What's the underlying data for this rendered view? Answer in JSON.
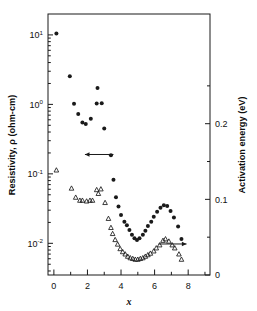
{
  "figure": {
    "background": "#ffffff",
    "foreground": "#1a1a1a"
  },
  "axes": {
    "left": {
      "title": "Resistivity, ρ (ohm-cm)",
      "scale": "log",
      "ticks": [
        {
          "mantissa": "10",
          "exponent": "1",
          "value": 10
        },
        {
          "mantissa": "10",
          "exponent": "0",
          "value": 1
        },
        {
          "mantissa": "10",
          "exponent": "-1",
          "value": 0.1
        },
        {
          "mantissa": "10",
          "exponent": "-2",
          "value": 0.01
        }
      ],
      "range": [
        0.0035,
        20
      ]
    },
    "right": {
      "title": "Activation energy (eV)",
      "scale": "linear",
      "ticks": [
        "0",
        "0.1",
        "0.2"
      ],
      "tick_values": [
        0,
        0.1,
        0.2
      ],
      "minor_tick_values": [
        0.05,
        0.15,
        0.25
      ],
      "range": [
        0,
        0.345
      ]
    },
    "bottom": {
      "title": "x",
      "scale": "linear",
      "ticks": [
        "0",
        "2",
        "4",
        "6",
        "8"
      ],
      "tick_values": [
        0,
        2,
        4,
        6,
        8
      ],
      "minor_tick_values": [
        1,
        3,
        5,
        7,
        9
      ],
      "range": [
        -0.35,
        9.3
      ]
    }
  },
  "annotations": [
    {
      "name": "left-pointing-arrow",
      "direction": "left",
      "x_start": 3.55,
      "x_end": 1.85,
      "y_value": 0.19,
      "axis": "left"
    },
    {
      "name": "right-pointing-arrow",
      "direction": "right",
      "x_start": 6.25,
      "x_end": 7.9,
      "y_value": 0.041,
      "axis": "right"
    }
  ],
  "chart_data": {
    "type": "scatter",
    "title": "",
    "xlabel": "x",
    "ylabel": "Resistivity, ρ (ohm-cm)",
    "y2label": "Activation energy (eV)",
    "xlim": [
      -0.35,
      9.3
    ],
    "ylim": [
      0.0035,
      20
    ],
    "y2lim": [
      0,
      0.345
    ],
    "yscale": "log",
    "grid": false,
    "legend": "none",
    "series": [
      {
        "name": "Resistivity",
        "marker": "filled-circle",
        "axis": "left",
        "points": [
          [
            0.15,
            10.5
          ],
          [
            0.95,
            2.55
          ],
          [
            1.2,
            1.02
          ],
          [
            1.45,
            0.73
          ],
          [
            1.7,
            0.55
          ],
          [
            1.9,
            0.52
          ],
          [
            2.2,
            0.62
          ],
          [
            2.55,
            1.03
          ],
          [
            2.6,
            1.72
          ],
          [
            2.85,
            1.04
          ],
          [
            3.0,
            0.45
          ],
          [
            3.4,
            0.185
          ],
          [
            3.55,
            0.082
          ],
          [
            3.7,
            0.046
          ],
          [
            3.85,
            0.034
          ],
          [
            4.0,
            0.0255
          ],
          [
            4.2,
            0.0205
          ],
          [
            4.35,
            0.0182
          ],
          [
            4.5,
            0.0155
          ],
          [
            4.65,
            0.0133
          ],
          [
            4.8,
            0.0118
          ],
          [
            4.95,
            0.0112
          ],
          [
            5.1,
            0.0118
          ],
          [
            5.3,
            0.0133
          ],
          [
            5.45,
            0.0152
          ],
          [
            5.6,
            0.0178
          ],
          [
            5.8,
            0.0205
          ],
          [
            5.95,
            0.0242
          ],
          [
            6.15,
            0.0285
          ],
          [
            6.35,
            0.0325
          ],
          [
            6.55,
            0.0352
          ],
          [
            6.75,
            0.0345
          ],
          [
            6.95,
            0.0292
          ],
          [
            7.15,
            0.0235
          ],
          [
            7.4,
            0.0175
          ],
          [
            7.6,
            0.0115
          ]
        ]
      },
      {
        "name": "Activation energy",
        "marker": "open-triangle",
        "axis": "right",
        "points": [
          [
            0.15,
            0.1385
          ],
          [
            1.05,
            0.1145
          ],
          [
            1.3,
            0.1025
          ],
          [
            1.55,
            0.0985
          ],
          [
            1.7,
            0.0985
          ],
          [
            1.95,
            0.0975
          ],
          [
            2.15,
            0.0985
          ],
          [
            2.3,
            0.0985
          ],
          [
            2.55,
            0.1125
          ],
          [
            2.65,
            0.1075
          ],
          [
            2.8,
            0.1135
          ],
          [
            3.05,
            0.0955
          ],
          [
            3.25,
            0.0745
          ],
          [
            3.4,
            0.0625
          ],
          [
            3.5,
            0.0545
          ],
          [
            3.65,
            0.0465
          ],
          [
            3.8,
            0.0405
          ],
          [
            3.95,
            0.0345
          ],
          [
            4.1,
            0.0305
          ],
          [
            4.25,
            0.0275
          ],
          [
            4.4,
            0.0245
          ],
          [
            4.55,
            0.0225
          ],
          [
            4.7,
            0.0215
          ],
          [
            4.85,
            0.0205
          ],
          [
            5.0,
            0.0205
          ],
          [
            5.15,
            0.0215
          ],
          [
            5.3,
            0.0225
          ],
          [
            5.45,
            0.0245
          ],
          [
            5.6,
            0.0265
          ],
          [
            5.75,
            0.0285
          ],
          [
            5.95,
            0.0315
          ],
          [
            6.1,
            0.0355
          ],
          [
            6.3,
            0.0395
          ],
          [
            6.5,
            0.0455
          ],
          [
            6.65,
            0.0475
          ],
          [
            6.85,
            0.0445
          ],
          [
            7.05,
            0.0395
          ],
          [
            7.2,
            0.0355
          ],
          [
            7.45,
            0.0275
          ],
          [
            7.6,
            0.0205
          ]
        ]
      }
    ]
  }
}
